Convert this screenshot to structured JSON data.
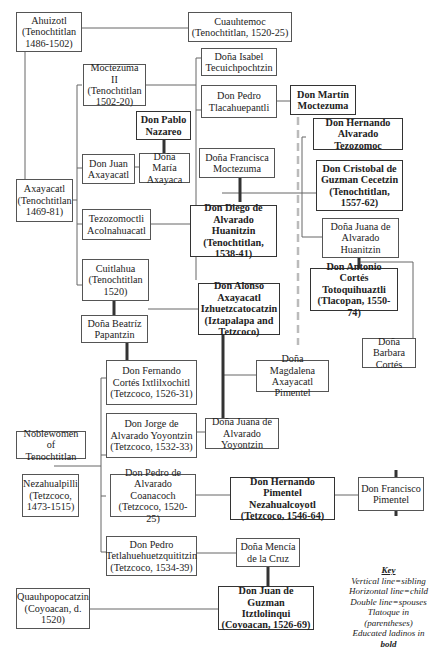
{
  "diagram": {
    "type": "genealogy",
    "nodes": {
      "ahuizotl": {
        "label": "Ahuizotl\n(Tenochtitlan\n1486-1502)",
        "bold": false
      },
      "cuauhtemoc": {
        "label": "Cuauhtemoc\n(Tenochtitlan, 1520-25)",
        "bold": false
      },
      "moctezuma_ii": {
        "label": "Moctezuma II\n(Tenochtitlan\n1502-20)",
        "bold": false
      },
      "isabel": {
        "label": "Doña Isabel\nTecuichpochtzin",
        "bold": false
      },
      "pedro_tlacahuepantli": {
        "label": "Don Pedro\nTlacahuepantli",
        "bold": false
      },
      "martin_moctezuma": {
        "label": "Don Martín\nMoctezuma",
        "bold": true
      },
      "pablo_nazareo": {
        "label": "Don Pablo\nNazareo",
        "bold": true
      },
      "hernando_tezozomoc": {
        "label": "Don Hernando\nAlvarado Tezozomoc",
        "bold": true
      },
      "juan_axayacatl": {
        "label": "Don Juan\nAxayacatl",
        "bold": false
      },
      "maria_axayaca": {
        "label": "Doña María\nAxayaca",
        "bold": false
      },
      "francisca_moctezuma": {
        "label": "Doña Francisca\nMoctezuma",
        "bold": false
      },
      "cristobal_cecetzin": {
        "label": "Don Cristobal de\nGuzman Cecetzin\n(Tenochtitlan,\n1557-62)",
        "bold": true
      },
      "axayacatl": {
        "label": "Axayacatl\n(Tenochtitlan\n1469-81)",
        "bold": false
      },
      "tezozomoctli": {
        "label": "Tezozomoctli\nAcolnahuacatl",
        "bold": false
      },
      "diego_huanitzin": {
        "label": "Don Diego de\nAlvarado Huanitzin\n(Tenochtitlan,\n1538-41)",
        "bold": true
      },
      "juana_huanitzin": {
        "label": "Doña Juana de\nAlvarado\nHuanitzin",
        "bold": false
      },
      "antonio_totoquihuaztli": {
        "label": "Don Antonio Cortés\nTotoquihuaztli\n(Tlacopan, 1550-74)",
        "bold": true
      },
      "cuitlahua": {
        "label": "Cuitlahua\n(Tenochtitlan\n1520)",
        "bold": false
      },
      "alonso_izhuetzcatocatzin": {
        "label": "Don Alonso Axayacatl\nIzhuetzcatocatzin\n(Iztapalapa and\nTetzcoco)",
        "bold": true
      },
      "beatriz_papantzin": {
        "label": "Doña Beatríz\nPapantzin",
        "bold": false
      },
      "barbara_cortes": {
        "label": "Doña Barbara\nCortés",
        "bold": false
      },
      "fernando_ixtlilxochitl": {
        "label": "Don Fernando\nCortés Ixtlilxochitl\n(Tetzcoco, 1526-31)",
        "bold": false
      },
      "magdalena_pimentel": {
        "label": "Doña Magdalena\nAxayacatl Pimentel",
        "bold": false
      },
      "jorge_yoyontzin": {
        "label": "Don Jorge de\nAlvarado Yoyontzin\n(Tetzcoco, 1532-33)",
        "bold": false
      },
      "juana_yoyontzin": {
        "label": "Doña Juana de\nAlvarado Yoyontzin",
        "bold": false
      },
      "noblewomen": {
        "label": "Noblewomen of\nTenochtitlan",
        "bold": false
      },
      "nezahualpilli": {
        "label": "Nezahualpilli\n(Tetzcoco,\n1473-1515)",
        "bold": false
      },
      "pedro_coanacoch": {
        "label": "Don Pedro de\nAlvarado Coanacoch\n(Tetzcoco, 1520-25)",
        "bold": false
      },
      "hernando_nezahualcoyotl": {
        "label": "Don Hernando Pimentel\nNezahualcoyotl\n(Tetzcoco, 1546-64)",
        "bold": true
      },
      "francisco_pimentel": {
        "label": "Don Francisco\nPimentel",
        "bold": false
      },
      "pedro_tetlahuehuetzquititzin": {
        "label": "Don Pedro\nTetlahuehuetzquititzin\n(Tetzcoco, 1534-39)",
        "bold": false
      },
      "mencia_cruz": {
        "label": "Doña Mencía\nde la Cruz",
        "bold": false
      },
      "quauhpopocatzin": {
        "label": "Quauhpopocatzin\n(Coyoacan, d.\n1520)",
        "bold": false
      },
      "juan_itztlolinqui": {
        "label": "Don Juan de Guzman\nItztlolinqui\n(Coyoacan, 1526-69)",
        "bold": true
      }
    },
    "key": {
      "title": "Key",
      "lines": [
        "Vertical line=sibling",
        "Horizontal line=child",
        "Double line=spouses",
        "Tlatoque in (parentheses)"
      ],
      "last_prefix": "Educated ladinos in ",
      "last_bold": "bold"
    },
    "colors": {
      "line": "#555555",
      "spouse_line": "#333333",
      "dashed_line": "#bbbbbb",
      "box_border": "#555555"
    }
  }
}
